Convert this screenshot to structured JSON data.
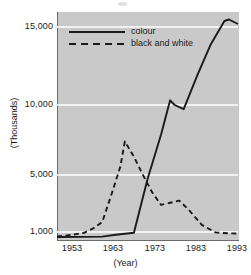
{
  "chart_data": {
    "type": "line",
    "title": "",
    "xlabel": "(Year)",
    "ylabel": "(Thousands)",
    "xlim": [
      1953,
      1993
    ],
    "ylim": [
      0,
      16000
    ],
    "grid": true,
    "grid_color": "#ffffff",
    "plot_background": "#c9c9c9",
    "legend_position": "top-left inside plot",
    "xticks": [
      "1953",
      "1963",
      "1973",
      "1983",
      "1993"
    ],
    "xtick_values": [
      1953,
      1963,
      1973,
      1983,
      1993
    ],
    "yticks": [
      "1,000",
      "5,000",
      "10,000",
      "15,000"
    ],
    "ytick_values": [
      1000,
      5000,
      10000,
      15000
    ],
    "series": [
      {
        "name": "colour",
        "style": "solid",
        "color": "#1a1a1a",
        "x": [
          1953,
          1963,
          1966,
          1968,
          1970,
          1973,
          1976,
          1978,
          1979,
          1981,
          1984,
          1987,
          1990,
          1991,
          1993
        ],
        "values": [
          380,
          420,
          650,
          780,
          900,
          4700,
          7900,
          10300,
          10000,
          9700,
          11900,
          13900,
          15400,
          15500,
          15200
        ]
      },
      {
        "name": "black and white",
        "style": "dashed",
        "color": "#1a1a1a",
        "x": [
          1953,
          1956,
          1959,
          1961,
          1963,
          1965,
          1967,
          1968,
          1970,
          1972,
          1974,
          1976,
          1978,
          1980,
          1982,
          1985,
          1988,
          1991,
          1993
        ],
        "values": [
          430,
          620,
          900,
          1250,
          1700,
          3600,
          5600,
          7400,
          6300,
          5000,
          3800,
          2900,
          3050,
          3200,
          2600,
          1500,
          950,
          830,
          820
        ]
      }
    ]
  },
  "legend": {
    "items": [
      {
        "label": "colour",
        "style": "solid"
      },
      {
        "label": "black and white",
        "style": "dashed"
      }
    ]
  },
  "axes": {
    "y_axis_title": "(Thousands)",
    "x_axis_title": "(Year)"
  }
}
